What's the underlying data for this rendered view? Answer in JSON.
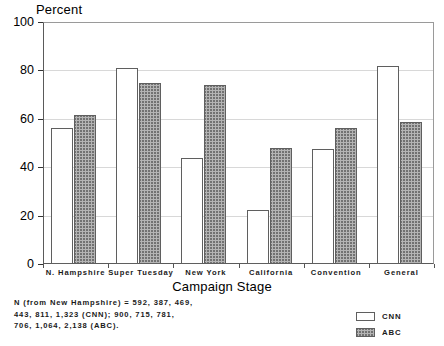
{
  "chart_data": {
    "type": "bar",
    "title": "",
    "ylabel": "Percent",
    "xlabel": "Campaign Stage",
    "ylim": [
      0,
      100
    ],
    "yticks": [
      0,
      20,
      40,
      60,
      80,
      100
    ],
    "grid": true,
    "legend_position": "bottom-right",
    "categories": [
      "N. Hampshire",
      "Super Tuesday",
      "New York",
      "California",
      "Convention",
      "General"
    ],
    "series": [
      {
        "name": "CNN",
        "values": [
          56,
          81,
          44,
          22.5,
          47.5,
          82
        ]
      },
      {
        "name": "ABC",
        "values": [
          61.5,
          75,
          74,
          48,
          56,
          58.5
        ]
      }
    ],
    "annotations": [
      "N (from New Hampshire) = 592, 387, 469,",
      "443, 811, 1,323 (CNN); 900, 715, 781,",
      "706, 1,064, 2,138 (ABC)."
    ]
  },
  "legend": {
    "items": [
      {
        "label": "CNN",
        "swatch": "white-square"
      },
      {
        "label": "ABC",
        "swatch": "hatched-square"
      }
    ]
  }
}
